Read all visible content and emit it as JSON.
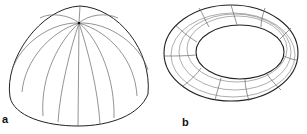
{
  "panels": [
    {
      "id": "a",
      "label": "a",
      "shape": "hemisphere",
      "meridian_count": 12
    },
    {
      "id": "b",
      "label": "b",
      "shape": "torus",
      "segment_count": 12
    }
  ],
  "colors": {
    "stroke": "#222222",
    "grid": "#777777",
    "background": "#ffffff"
  }
}
